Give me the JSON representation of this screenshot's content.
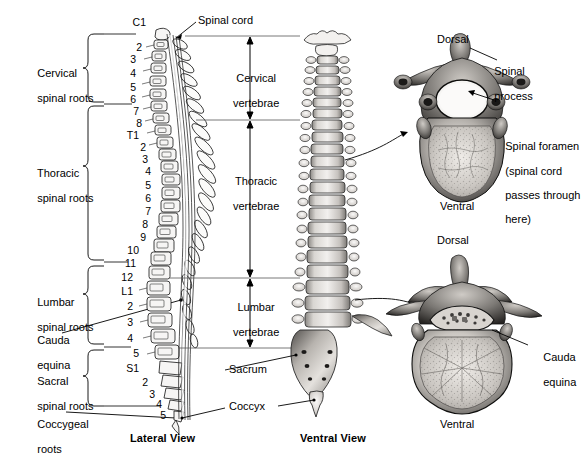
{
  "figure": {
    "footer_note": ""
  },
  "left_brackets": [
    {
      "id": "cervical",
      "label_line1": "Cervical",
      "label_line2": "spinal roots"
    },
    {
      "id": "thoracic",
      "label_line1": "Thoracic",
      "label_line2": "spinal roots"
    },
    {
      "id": "lumbar",
      "label_line1": "Lumbar",
      "label_line2": "spinal roots"
    },
    {
      "id": "sacral",
      "label_line1": "Sacral",
      "label_line2": "spinal roots"
    }
  ],
  "left_callouts": [
    {
      "id": "cauda-equina",
      "line1": "Cauda",
      "line2": "equina"
    },
    {
      "id": "coccygeal",
      "line1": "Coccygeal",
      "line2": "roots"
    }
  ],
  "vertebra_numbers": [
    {
      "text": "C1",
      "x": 146,
      "y": 17
    },
    {
      "text": "2",
      "x": 142,
      "y": 42
    },
    {
      "text": "3",
      "x": 136,
      "y": 54
    },
    {
      "text": "4",
      "x": 136,
      "y": 68
    },
    {
      "text": "5",
      "x": 136,
      "y": 82
    },
    {
      "text": "6",
      "x": 136,
      "y": 94
    },
    {
      "text": "7",
      "x": 139,
      "y": 106
    },
    {
      "text": "8",
      "x": 142,
      "y": 118
    },
    {
      "text": "T1",
      "x": 139,
      "y": 130
    },
    {
      "text": "2",
      "x": 146,
      "y": 142
    },
    {
      "text": "3",
      "x": 148,
      "y": 154
    },
    {
      "text": "4",
      "x": 151,
      "y": 166
    },
    {
      "text": "5",
      "x": 151,
      "y": 180
    },
    {
      "text": "6",
      "x": 151,
      "y": 193
    },
    {
      "text": "7",
      "x": 151,
      "y": 206
    },
    {
      "text": "8",
      "x": 148,
      "y": 219
    },
    {
      "text": "9",
      "x": 146,
      "y": 232
    },
    {
      "text": "10",
      "x": 139,
      "y": 245
    },
    {
      "text": "11",
      "x": 136,
      "y": 258
    },
    {
      "text": "12",
      "x": 133,
      "y": 272
    },
    {
      "text": "L1",
      "x": 133,
      "y": 286
    },
    {
      "text": "2",
      "x": 133,
      "y": 301
    },
    {
      "text": "3",
      "x": 133,
      "y": 317
    },
    {
      "text": "4",
      "x": 133,
      "y": 333
    },
    {
      "text": "5",
      "x": 139,
      "y": 348
    },
    {
      "text": "S1",
      "x": 139,
      "y": 363
    },
    {
      "text": "2",
      "x": 148,
      "y": 377
    },
    {
      "text": "3",
      "x": 155,
      "y": 389
    },
    {
      "text": "4",
      "x": 162,
      "y": 399
    },
    {
      "text": "5",
      "x": 166,
      "y": 410
    }
  ],
  "spans": [
    {
      "id": "cervical-vertebrae",
      "line1": "Cervical",
      "line2": "vertebrae"
    },
    {
      "id": "thoracic-vertebrae",
      "line1": "Thoracic",
      "line2": "vertebrae"
    },
    {
      "id": "lumbar-vertebrae",
      "line1": "Lumbar",
      "line2": "vertebrae"
    }
  ],
  "callouts": {
    "spinal_cord": "Spinal cord",
    "sacrum": "Sacrum",
    "coccyx": "Coccyx"
  },
  "view_names": {
    "lateral": "Lateral View",
    "ventral": "Ventral View"
  },
  "upper_vertebra": {
    "dorsal": "Dorsal",
    "ventral": "Ventral",
    "spinal_process_line1": "Spinal",
    "spinal_process_line2": "process",
    "spinal_foramen_line1": "Spinal foramen",
    "spinal_foramen_line2": "(spinal cord",
    "spinal_foramen_line3": "passes through",
    "spinal_foramen_line4": "here)"
  },
  "lower_vertebra": {
    "dorsal": "Dorsal",
    "ventral": "Ventral",
    "cauda_line1": "Cauda",
    "cauda_line2": "equina"
  },
  "colors": {
    "ink": "#000000",
    "background": "#ffffff",
    "bone_light": "#e9e7e4",
    "bone_mid": "#b9b5b0",
    "bone_dark": "#6d6a67",
    "photo_dark": "#3a3836",
    "photo_mid": "#8e8b87",
    "photo_light": "#d8d5d1"
  }
}
